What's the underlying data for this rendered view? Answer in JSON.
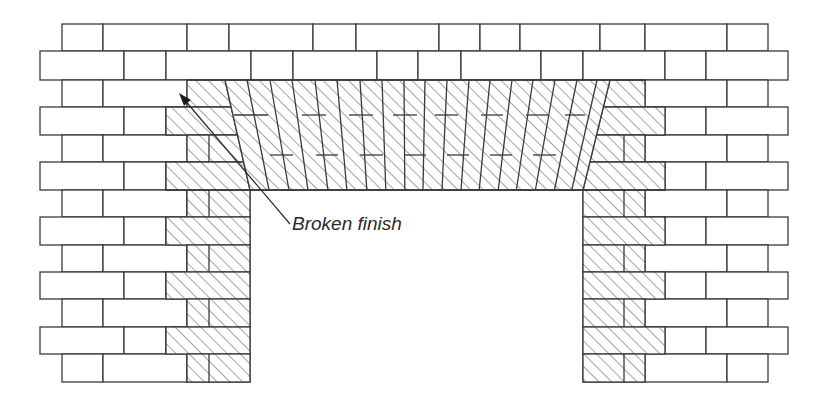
{
  "figure": {
    "type": "brick-wall-opening-with-flat-arch",
    "colors": {
      "line": "#3a3a3a",
      "background": "#ffffff",
      "hatch": "#4a4a4a"
    },
    "annotation": {
      "text": "Broken finish",
      "x": 292,
      "y": 213,
      "arrow_from": [
        290,
        224
      ],
      "arrow_to": [
        179,
        93
      ]
    }
  },
  "wall": {
    "rows": [
      {
        "y": 24,
        "h": 27,
        "x0": 62,
        "x1": 768,
        "joints": [
          103,
          187,
          229,
          313,
          356,
          439,
          480,
          520,
          600,
          645,
          727
        ]
      },
      {
        "y": 51,
        "h": 29,
        "x0": 40,
        "x1": 788,
        "joints": [
          124,
          166,
          251,
          293,
          377,
          418,
          461,
          541,
          583,
          665,
          706
        ]
      },
      {
        "y": 80,
        "h": 27,
        "x0": 62,
        "x1": 768,
        "joints": [
          103,
          187,
          645,
          727
        ]
      },
      {
        "y": 107,
        "h": 28,
        "x0": 40,
        "x1": 788,
        "joints": [
          124,
          166,
          665,
          706
        ]
      },
      {
        "y": 135,
        "h": 27,
        "x0": 62,
        "x1": 768,
        "joints": [
          103,
          187,
          209,
          624,
          645,
          727
        ]
      },
      {
        "y": 162,
        "h": 28,
        "x0": 40,
        "x1": 788,
        "joints": [
          124,
          166,
          665,
          706
        ]
      },
      {
        "y": 190,
        "h": 27,
        "x0": 62,
        "x1": 768,
        "joints": [
          103,
          187,
          209,
          250,
          583,
          624,
          645,
          727
        ]
      },
      {
        "y": 217,
        "h": 28,
        "x0": 40,
        "x1": 788,
        "joints": [
          124,
          166,
          250,
          583,
          665,
          706
        ]
      },
      {
        "y": 245,
        "h": 27,
        "x0": 62,
        "x1": 768,
        "joints": [
          103,
          187,
          209,
          250,
          583,
          624,
          645,
          727
        ]
      },
      {
        "y": 272,
        "h": 27,
        "x0": 40,
        "x1": 788,
        "joints": [
          124,
          166,
          250,
          583,
          665,
          706
        ]
      },
      {
        "y": 299,
        "h": 28,
        "x0": 62,
        "x1": 768,
        "joints": [
          103,
          187,
          209,
          250,
          583,
          624,
          645,
          727
        ]
      },
      {
        "y": 327,
        "h": 27,
        "x0": 40,
        "x1": 788,
        "joints": [
          124,
          166,
          250,
          583,
          665,
          706
        ]
      },
      {
        "y": 354,
        "h": 28,
        "x0": 62,
        "x1": 768,
        "joints": [
          103,
          187,
          209,
          250,
          583,
          624,
          645,
          727
        ]
      }
    ],
    "opening": {
      "x0": 250,
      "x1": 583,
      "y0": 190,
      "y1": 382
    }
  },
  "hatched_regions": [
    {
      "name": "left-abutment-row3",
      "points": [
        [
          187,
          80
        ],
        [
          225,
          80
        ],
        [
          231,
          107
        ],
        [
          166,
          107
        ],
        [
          166,
          107
        ],
        [
          187,
          107
        ]
      ]
    },
    {
      "name": "left-abutment-row4",
      "points": [
        [
          166,
          107
        ],
        [
          231,
          107
        ],
        [
          237,
          135
        ],
        [
          166,
          135
        ]
      ]
    },
    {
      "name": "left-abutment-row5",
      "points": [
        [
          187,
          135
        ],
        [
          237,
          135
        ],
        [
          243,
          162
        ],
        [
          187,
          162
        ]
      ]
    },
    {
      "name": "left-abutment-row6",
      "points": [
        [
          166,
          162
        ],
        [
          243,
          162
        ],
        [
          250,
          190
        ],
        [
          166,
          190
        ]
      ]
    },
    {
      "name": "right-abutment-row3",
      "points": [
        [
          610,
          80
        ],
        [
          645,
          80
        ],
        [
          645,
          107
        ],
        [
          604,
          107
        ]
      ]
    },
    {
      "name": "right-abutment-row4",
      "points": [
        [
          604,
          107
        ],
        [
          665,
          107
        ],
        [
          665,
          135
        ],
        [
          597,
          135
        ]
      ]
    },
    {
      "name": "right-abutment-row5",
      "points": [
        [
          597,
          135
        ],
        [
          645,
          135
        ],
        [
          645,
          162
        ],
        [
          590,
          162
        ]
      ]
    },
    {
      "name": "right-abutment-row6",
      "points": [
        [
          590,
          162
        ],
        [
          665,
          162
        ],
        [
          665,
          190
        ],
        [
          583,
          190
        ]
      ]
    },
    {
      "name": "left-jamb",
      "rect": [
        166,
        190,
        84,
        192
      ],
      "odd_inset": 22
    },
    {
      "name": "right-jamb",
      "rect": [
        583,
        190,
        82,
        192
      ],
      "odd_inset": 20
    },
    {
      "name": "arch",
      "points": [
        [
          225,
          80
        ],
        [
          610,
          80
        ],
        [
          583,
          190
        ],
        [
          250,
          190
        ]
      ]
    }
  ],
  "voussoirs": {
    "top": [
      247,
      270,
      292,
      315,
      337,
      360,
      382,
      404,
      425,
      447,
      469,
      490,
      512,
      533,
      555,
      577,
      597
    ],
    "bottom": [
      268,
      283,
      297,
      313,
      329,
      345,
      360,
      376,
      390,
      406,
      422,
      437,
      452,
      468,
      483,
      500,
      515
    ],
    "bed_joints": [
      {
        "y": 115,
        "segments": [
          [
            234,
            268
          ],
          [
            302,
            326
          ],
          [
            349,
            373
          ],
          [
            393,
            417
          ],
          [
            435,
            458
          ],
          [
            481,
            503
          ],
          [
            526,
            548
          ],
          [
            565,
            585
          ]
        ]
      },
      {
        "y": 155,
        "segments": [
          [
            270,
            293
          ],
          [
            316,
            338
          ],
          [
            360,
            383
          ],
          [
            404,
            426
          ],
          [
            447,
            469
          ],
          [
            490,
            512
          ],
          [
            533,
            556
          ]
        ]
      }
    ]
  }
}
